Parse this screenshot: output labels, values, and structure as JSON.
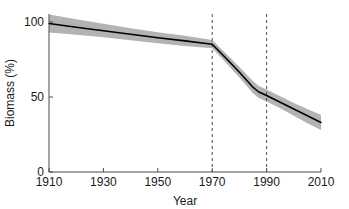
{
  "chart_data": {
    "type": "line",
    "title": "",
    "xlabel": "Year",
    "ylabel": "Biomass (%)",
    "xlim": [
      1910,
      2010
    ],
    "ylim": [
      0,
      105
    ],
    "xticks": [
      1910,
      1930,
      1950,
      1970,
      1990,
      2010
    ],
    "xticklabels": [
      "1910",
      "1930",
      "1950",
      "1970",
      "1990",
      "2010"
    ],
    "yticks": [
      0,
      50,
      100
    ],
    "yticklabels": [
      "0",
      "50",
      "100"
    ],
    "grid": false,
    "legend": null,
    "x": [
      1910,
      1920,
      1930,
      1940,
      1950,
      1960,
      1970,
      1975,
      1980,
      1985,
      1987,
      1990,
      1995,
      2000,
      2005,
      2010
    ],
    "series": [
      {
        "name": "Biomass",
        "color": "#000000",
        "values": [
          99.0,
          96.5,
          94.2,
          91.8,
          89.5,
          87.4,
          85.2,
          76.0,
          66.5,
          56.5,
          53.5,
          51.0,
          46.5,
          42.0,
          37.5,
          33.0
        ]
      }
    ],
    "uncertainty_band": {
      "name": "confidence-band",
      "color": "#b3b3b3",
      "lower": [
        93.0,
        91.5,
        89.8,
        87.8,
        85.8,
        84.0,
        82.5,
        73.0,
        63.0,
        52.5,
        49.5,
        47.0,
        42.5,
        37.5,
        32.5,
        28.0
      ],
      "upper": [
        105.0,
        101.8,
        98.8,
        95.8,
        93.2,
        90.8,
        88.0,
        79.0,
        70.0,
        60.5,
        57.5,
        55.0,
        50.5,
        46.0,
        42.0,
        38.0
      ]
    },
    "reference_lines": [
      {
        "name": "reference-line-1970",
        "x": 1970,
        "style": "dashed",
        "color": "#4d4d4d"
      },
      {
        "name": "reference-line-1990",
        "x": 1990,
        "style": "dashed",
        "color": "#4d4d4d"
      }
    ]
  }
}
